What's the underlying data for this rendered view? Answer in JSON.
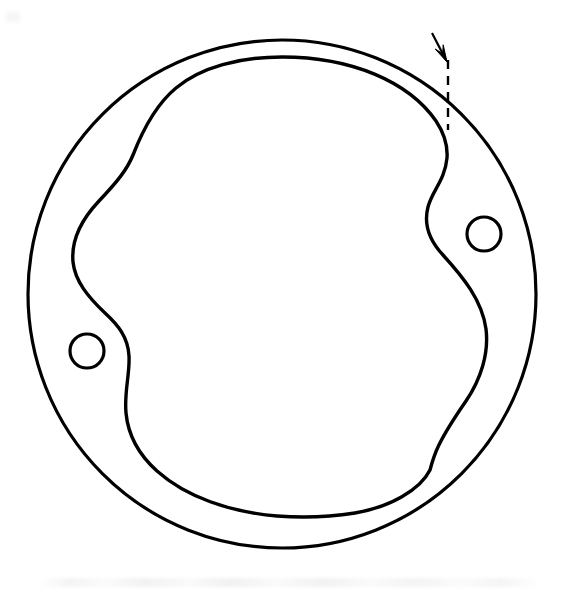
{
  "figure": {
    "kind": "engineering-line-drawing",
    "title": "",
    "caption": "",
    "background_color": "#ffffff",
    "stroke_color": "#000000",
    "canvas": {
      "width": 579,
      "height": 599
    }
  },
  "geometry": {
    "outer_circle": {
      "name": "outer-disc-boundary",
      "center_x": 282,
      "center_y": 294,
      "radius": 254,
      "stroke_width": 3.2
    },
    "inner_contour": {
      "name": "inner-chamber-profile",
      "stroke_width": 3.4,
      "description": "closed lobed profile with two opposed S-shaped notches",
      "path": "M 282 57 C 352 57 409 82 436 121 C 444 133 448 144 447 158 C 445 180 432 191 428 207 C 423 226 430 241 443 255 C 463 277 482 300 486 329 C 489 353 481 379 466 401 C 437 443 434 455 430 470 C 420 490 390 507 355 513 C 330 517 302 518 277 516 C 230 512 186 497 157 471 C 138 454 128 434 126 413 C 124 392 130 374 129 356 C 128 337 118 325 105 313 C 88 297 75 281 73 262 C 71 240 82 219 99 201 C 116 183 127 170 133 155 C 140 137 153 107 176 88 C 201 67 240 57 282 57 Z"
    },
    "holes": [
      {
        "name": "bolt-hole-right",
        "center_x": 484,
        "center_y": 234,
        "radius": 17,
        "stroke_width": 3.2
      },
      {
        "name": "bolt-hole-left",
        "center_x": 87,
        "center_y": 351,
        "radius": 17,
        "stroke_width": 3.2
      }
    ],
    "leader": {
      "name": "clearance-leader",
      "dashed_line": {
        "x": 448,
        "y_start": 60,
        "y_end": 130,
        "stroke_width": 2.4,
        "dash_pattern": "9 7"
      },
      "arrow": {
        "tail_x": 432,
        "tail_y": 33,
        "tip_x": 447,
        "tip_y": 62,
        "head_length": 17,
        "head_width": 9,
        "stroke_width": 2.2
      }
    }
  },
  "labels": {
    "arrow_note": "",
    "outer_note": "",
    "inner_note": ""
  },
  "artifacts": {
    "bottom_scan_smudge": true,
    "top_left_speck": true
  }
}
